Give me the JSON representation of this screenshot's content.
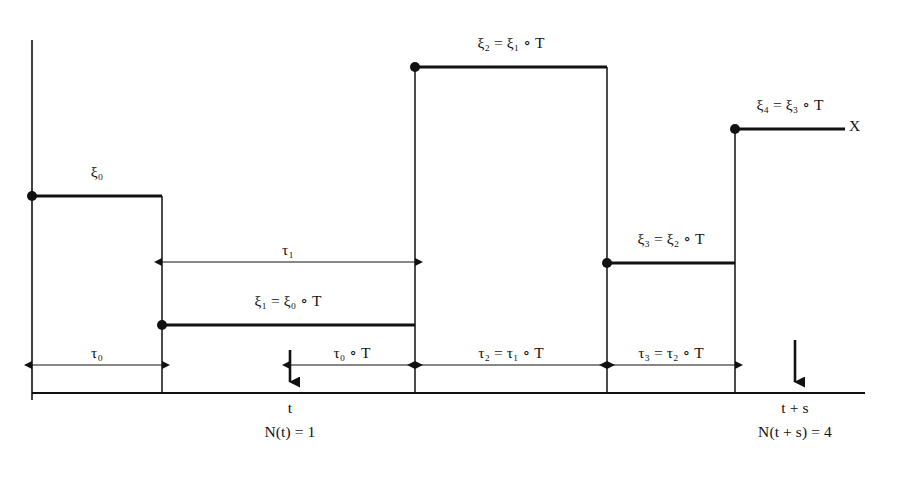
{
  "figure": {
    "process_label": "X",
    "background_color": "#ffffff",
    "ink_color": "#111111"
  },
  "axes": {
    "vertical_axis": {
      "x": 32,
      "y_top": 40,
      "y_bottom": 400
    },
    "baseline": {
      "y": 393,
      "x_start": 32,
      "x_end": 865
    }
  },
  "steps": [
    {
      "name": "xi0",
      "label": "ξ₀",
      "x_start": 32,
      "x_end": 162,
      "y": 196,
      "label_x": 97,
      "label_y": 172,
      "has_dot": true
    },
    {
      "name": "xi1",
      "label": "ξ₁ = ξ₀ ∘ T",
      "x_start": 162,
      "x_end": 415,
      "y": 325,
      "label_x": 288,
      "label_y": 301,
      "has_dot": true
    },
    {
      "name": "xi2",
      "label": "ξ₂ = ξ₁ ∘ T",
      "x_start": 415,
      "x_end": 607,
      "y": 67,
      "label_x": 511,
      "label_y": 43,
      "has_dot": true
    },
    {
      "name": "xi3",
      "label": "ξ₃ = ξ₂ ∘ T",
      "x_start": 607,
      "x_end": 735,
      "y": 263,
      "label_x": 671,
      "label_y": 239,
      "has_dot": true
    },
    {
      "name": "xi4",
      "label": "ξ₄ = ξ₃ ∘ T",
      "x_start": 735,
      "x_end": 845,
      "y": 129,
      "label_x": 790,
      "label_y": 105,
      "has_dot": true
    }
  ],
  "process_label": {
    "text": "X",
    "x": 851,
    "y": 120
  },
  "measures": [
    {
      "name": "tau0",
      "label": "τ₀",
      "x_start": 32,
      "x_end": 162,
      "y": 365,
      "label_x": 97,
      "label_y": 353
    },
    {
      "name": "tau1",
      "label": "τ₁",
      "x_start": 162,
      "x_end": 415,
      "y": 262,
      "label_x": 288,
      "label_y": 250
    },
    {
      "name": "tau0T",
      "label": "τ₀ ∘ T",
      "x_start": 290,
      "x_end": 415,
      "y": 365,
      "label_x": 352,
      "label_y": 353
    },
    {
      "name": "tau2",
      "label": "τ₂ = τ₁ ∘ T",
      "x_start": 415,
      "x_end": 607,
      "y": 365,
      "label_x": 511,
      "label_y": 353
    },
    {
      "name": "tau3",
      "label": "τ₃ = τ₂ ∘ T",
      "x_start": 607,
      "x_end": 735,
      "y": 365,
      "label_x": 671,
      "label_y": 353
    }
  ],
  "time_markers": [
    {
      "name": "t",
      "arrow_x": 290,
      "arrow_y_top": 350,
      "arrow_y_bottom": 393,
      "time_label": "t",
      "time_label_x": 290,
      "time_label_y": 401,
      "count_label": "N(t) = 1",
      "count_label_x": 290,
      "count_label_y": 427
    },
    {
      "name": "t-plus-s",
      "arrow_x": 795,
      "arrow_y_top": 340,
      "arrow_y_bottom": 393,
      "time_label": "t + s",
      "time_label_x": 795,
      "time_label_y": 401,
      "count_label": "N(t + s) = 4",
      "count_label_x": 795,
      "count_label_y": 427
    }
  ]
}
